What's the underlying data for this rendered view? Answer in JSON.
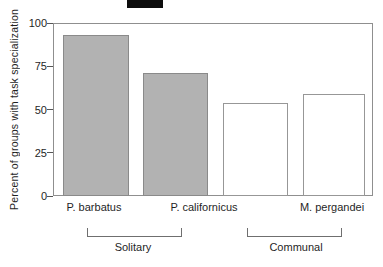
{
  "chart_data": {
    "type": "bar",
    "title": "",
    "xlabel": "",
    "ylabel": "Percent of groups with task specialization",
    "ylim": [
      0,
      100
    ],
    "yticks": [
      0,
      25,
      50,
      75,
      100
    ],
    "bars": [
      {
        "value": 93,
        "fill": "gray"
      },
      {
        "value": 71,
        "fill": "gray"
      },
      {
        "value": 54,
        "fill": "white"
      },
      {
        "value": 59,
        "fill": "white"
      }
    ],
    "x_tick_labels": [
      "P. barbatus",
      "P. californicus",
      "M. pergandei"
    ],
    "group_brackets": [
      {
        "label": "Solitary"
      },
      {
        "label": "Communal"
      }
    ],
    "legend": "none",
    "grid": false
  },
  "colors": {
    "gray_bar_fill": "#b2b2b2",
    "gray_bar_border": "#8a8a8a",
    "white_bar_fill": "#ffffff",
    "white_bar_border": "#979797",
    "frame": "#8f8f8f",
    "text": "#1f1f1f",
    "artifact": "#0d0d0d"
  }
}
